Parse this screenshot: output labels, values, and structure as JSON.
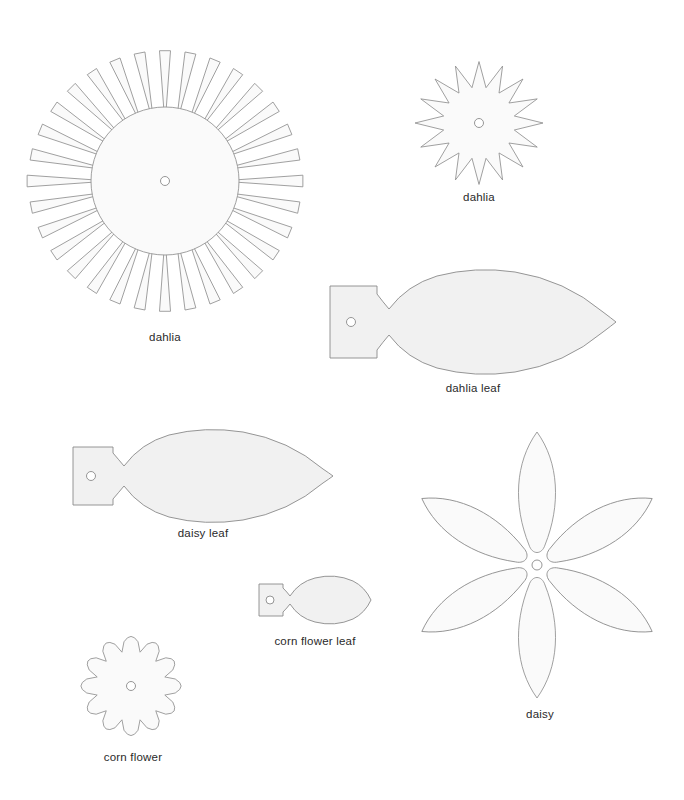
{
  "page": {
    "background_color": "#ffffff",
    "width": 684,
    "height": 800
  },
  "style": {
    "shape_fill": "#f1f1f1",
    "shape_fill_pale": "#fafafa",
    "shape_stroke": "#8a8a8a",
    "hole_fill": "#ffffff",
    "label_color": "#2a2a2a"
  },
  "templates": [
    {
      "id": "dahlia-large",
      "label": "dahlia",
      "kind": "flower",
      "petal_style": "narrow-tapered-spoke",
      "petal_count": 32,
      "has_center_hole": true,
      "center": {
        "x": 165,
        "y": 181
      },
      "outer_radius": 138,
      "disc_radius": 74,
      "hole_radius": 4.5,
      "label_position": {
        "x": 165,
        "y": 333
      }
    },
    {
      "id": "dahlia-small",
      "label": "dahlia",
      "kind": "flower",
      "petal_style": "triangular-spike",
      "petal_count": 16,
      "has_center_hole": true,
      "center": {
        "x": 479,
        "y": 123
      },
      "outer_radius": 64,
      "disc_radius": 36,
      "hole_radius": 4.5,
      "label_position": {
        "x": 479,
        "y": 198
      }
    },
    {
      "id": "dahlia-leaf",
      "label": "dahlia leaf",
      "kind": "leaf",
      "has_tab": true,
      "has_center_hole": true,
      "hole_radius": 4.5,
      "bounds": {
        "x": 329,
        "y": 268,
        "width": 286,
        "height": 108
      },
      "label_position": {
        "x": 472,
        "y": 392
      }
    },
    {
      "id": "daisy-leaf",
      "label": "daisy leaf",
      "kind": "leaf",
      "has_tab": true,
      "has_center_hole": true,
      "hole_radius": 4.5,
      "bounds": {
        "x": 71,
        "y": 428,
        "width": 259,
        "height": 94
      },
      "label_position": {
        "x": 206,
        "y": 537
      }
    },
    {
      "id": "corn-flower-leaf",
      "label": "corn flower leaf",
      "kind": "leaf",
      "has_tab": true,
      "has_center_hole": true,
      "hole_radius": 4,
      "bounds": {
        "x": 259,
        "y": 575,
        "width": 110,
        "height": 53
      },
      "label_position": {
        "x": 314,
        "y": 647
      }
    },
    {
      "id": "daisy",
      "label": "daisy",
      "kind": "flower",
      "petal_style": "long-pointed-lanceolate",
      "petal_count": 6,
      "has_center_hole": true,
      "center": {
        "x": 535,
        "y": 563
      },
      "outer_radius": 133,
      "hole_radius": 5,
      "label_position": {
        "x": 540,
        "y": 714
      }
    },
    {
      "id": "corn-flower",
      "label": "corn flower",
      "kind": "flower",
      "petal_style": "rounded-triangular",
      "petal_count": 12,
      "has_center_hole": true,
      "center": {
        "x": 131,
        "y": 686
      },
      "outer_radius": 56,
      "disc_radius": 35,
      "hole_radius": 4.5,
      "label_position": {
        "x": 133,
        "y": 765
      }
    }
  ]
}
